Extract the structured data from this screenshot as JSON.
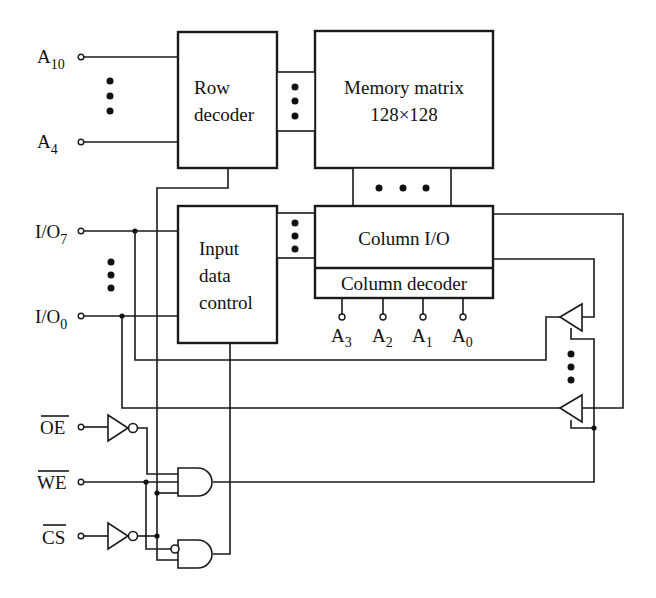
{
  "diagram": {
    "type": "SRAM block diagram",
    "blocks": {
      "row_decoder": {
        "line1": "Row",
        "line2": "decoder"
      },
      "memory_matrix": {
        "line1": "Memory matrix",
        "line2": "128×128"
      },
      "input_data_control": {
        "line1": "Input",
        "line2": "data",
        "line3": "control"
      },
      "column_io": {
        "label": "Column I/O"
      },
      "column_decoder": {
        "label": "Column decoder"
      }
    },
    "row_address_pins": [
      {
        "base": "A",
        "sub": "10"
      },
      {
        "base": "A",
        "sub": "4"
      }
    ],
    "io_pins": [
      {
        "base": "I/O",
        "sub": "7"
      },
      {
        "base": "I/O",
        "sub": "0"
      }
    ],
    "column_address_pins": [
      {
        "base": "A",
        "sub": "3"
      },
      {
        "base": "A",
        "sub": "2"
      },
      {
        "base": "A",
        "sub": "1"
      },
      {
        "base": "A",
        "sub": "0"
      }
    ],
    "control_pins": [
      {
        "label": "OE",
        "active_low": true
      },
      {
        "label": "WE",
        "active_low": true
      },
      {
        "label": "CS",
        "active_low": true
      }
    ],
    "ellipsis": "• • •",
    "colors": {
      "line": "#1a1a1a",
      "background": "#ffffff"
    }
  }
}
